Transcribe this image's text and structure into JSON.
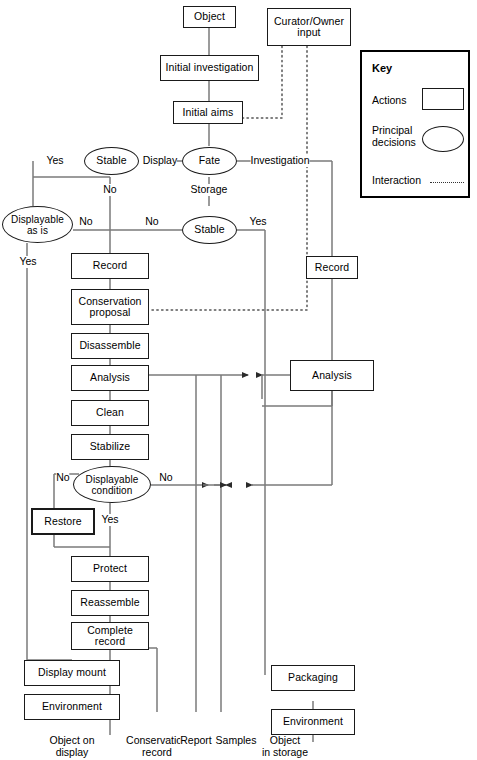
{
  "diagram": {
    "nodes": {
      "object": "Object",
      "initial_investigation": "Initial investigation",
      "initial_aims": "Initial aims",
      "curator_owner_input": "Curator/Owner\ninput",
      "stable_display": "Stable",
      "fate": "Fate",
      "stable_storage": "Stable",
      "displayable_as_is": "Displayable\nas is",
      "record_left": "Record",
      "record_right": "Record",
      "conservation_proposal": "Conservation\nproposal",
      "disassemble": "Disassemble",
      "analysis_left": "Analysis",
      "analysis_right": "Analysis",
      "clean": "Clean",
      "stabilize": "Stabilize",
      "displayable_condition": "Displayable\ncondition",
      "restore": "Restore",
      "protect": "Protect",
      "reassemble": "Reassemble",
      "complete_record": "Complete\nrecord",
      "display_mount": "Display mount",
      "environment_left": "Environment",
      "packaging": "Packaging",
      "environment_right": "Environment"
    },
    "edge_labels": {
      "yes_stable_display": "Yes",
      "display": "Display",
      "investigation": "Investigation",
      "no_stable_display": "No",
      "storage": "Storage",
      "no_displayable_as_is": "No",
      "no_mid": "No",
      "yes_stable_storage": "Yes",
      "yes_displayable_as_is": "Yes",
      "no_displayable_condition_left": "No",
      "no_displayable_condition_right": "No",
      "yes_displayable_condition": "Yes"
    },
    "outputs": {
      "object_on_display": "Object on\ndisplay",
      "conservation_record": "Conservation\nrecord",
      "report": "Report",
      "samples": "Samples",
      "object_in_storage": "Object\nin storage"
    },
    "key": {
      "title": "Key",
      "actions": "Actions",
      "principal_decisions": "Principal\ndecisions",
      "interaction": "Interaction"
    },
    "colors": {
      "stroke": "#1a1a1a",
      "line": "#6e6e6e",
      "background": "#ffffff"
    }
  }
}
